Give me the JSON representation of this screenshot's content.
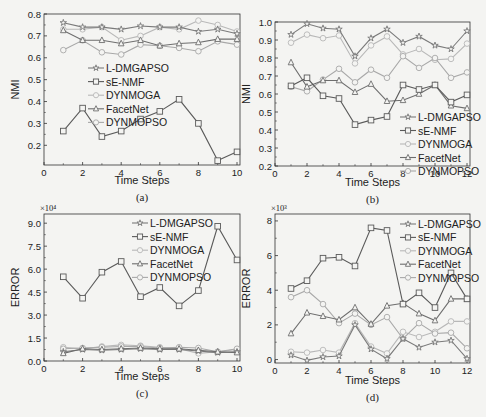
{
  "figure": {
    "panels": [
      {
        "id": "a",
        "caption": "(a)"
      },
      {
        "id": "b",
        "caption": "(b)"
      },
      {
        "id": "c",
        "caption": "(c)"
      },
      {
        "id": "d",
        "caption": "(d)"
      }
    ]
  },
  "series_styles": {
    "L-DMGAPSO": {
      "color": "#7a7a7a",
      "marker": "star"
    },
    "sE-NMF": {
      "color": "#5a5a5a",
      "marker": "square"
    },
    "DYNMOGA": {
      "color": "#b8b8b8",
      "marker": "circle"
    },
    "FacetNet": {
      "color": "#6e6e6e",
      "marker": "triangle"
    },
    "DYNMOPSO": {
      "color": "#a8a8a8",
      "marker": "circle"
    }
  },
  "chart_data": [
    {
      "panel": "a",
      "type": "line",
      "title": "",
      "caption": "(a)",
      "xlabel": "Time Steps",
      "ylabel": "NMI",
      "xlim": [
        0,
        10
      ],
      "ylim": [
        0.11,
        0.8
      ],
      "xticks": [
        0,
        2,
        4,
        6,
        8,
        10
      ],
      "yticks": [
        0.2,
        0.3,
        0.4,
        0.5,
        0.6,
        0.7,
        0.8
      ],
      "ytick_labels": [
        "0.2",
        "0.3",
        "0.4",
        "0.5",
        "0.6",
        "0.7",
        "0.8"
      ],
      "exponent_label": "",
      "legend_entries": [
        "L-DMGAPSO",
        "sE-NMF",
        "DYNMOGA",
        "FacetNet",
        "DYNMOPSO"
      ],
      "legend_position": "center-left",
      "grid": false,
      "x": [
        1,
        2,
        3,
        4,
        5,
        6,
        7,
        8,
        9,
        10
      ],
      "series": [
        {
          "name": "L-DMGAPSO",
          "values": [
            0.76,
            0.74,
            0.74,
            0.73,
            0.745,
            0.74,
            0.74,
            0.72,
            0.73,
            0.71
          ]
        },
        {
          "name": "sE-NMF",
          "values": [
            0.265,
            0.37,
            0.24,
            0.265,
            0.32,
            0.355,
            0.41,
            0.3,
            0.13,
            0.17
          ]
        },
        {
          "name": "DYNMOGA",
          "values": [
            0.73,
            0.73,
            0.74,
            0.68,
            0.7,
            0.74,
            0.73,
            0.77,
            0.75,
            0.72
          ]
        },
        {
          "name": "FacetNet",
          "values": [
            0.725,
            0.68,
            0.68,
            0.665,
            0.68,
            0.655,
            0.665,
            0.67,
            0.685,
            0.685
          ]
        },
        {
          "name": "DYNMOPSO",
          "values": [
            0.635,
            0.68,
            0.625,
            0.615,
            0.66,
            0.655,
            0.645,
            0.63,
            0.675,
            0.66
          ]
        }
      ]
    },
    {
      "panel": "b",
      "type": "line",
      "title": "",
      "caption": "(b)",
      "xlabel": "Time Steps",
      "ylabel": "NMI",
      "xlim": [
        0,
        12
      ],
      "ylim": [
        0.2,
        1.0
      ],
      "xticks": [
        0,
        2,
        4,
        6,
        8,
        10,
        12
      ],
      "yticks": [
        0.2,
        0.3,
        0.4,
        0.5,
        0.6,
        0.7,
        0.8,
        0.9,
        1.0
      ],
      "ytick_labels": [
        "0.2",
        "0.3",
        "0.4",
        "0.5",
        "0.6",
        "0.7",
        "0.8",
        "0.9",
        "1.0"
      ],
      "exponent_label": "",
      "legend_entries": [
        "L-DMGAPSO",
        "sE-NMF",
        "DYNMOGA",
        "FacetNet",
        "DYNMOPSO"
      ],
      "legend_position": "lower-right",
      "grid": false,
      "x": [
        1,
        2,
        3,
        4,
        5,
        6,
        7,
        8,
        9,
        10,
        11,
        12
      ],
      "series": [
        {
          "name": "L-DMGAPSO",
          "values": [
            0.93,
            0.99,
            0.965,
            0.96,
            0.81,
            0.91,
            0.96,
            0.885,
            0.92,
            0.87,
            0.85,
            0.95
          ]
        },
        {
          "name": "sE-NMF",
          "values": [
            0.645,
            0.69,
            0.59,
            0.575,
            0.43,
            0.455,
            0.475,
            0.65,
            0.625,
            0.65,
            0.555,
            0.595
          ]
        },
        {
          "name": "DYNMOGA",
          "values": [
            0.885,
            0.93,
            0.91,
            0.925,
            0.77,
            0.87,
            0.92,
            0.82,
            0.85,
            0.79,
            0.795,
            0.88
          ]
        },
        {
          "name": "FacetNet",
          "values": [
            0.775,
            0.64,
            0.675,
            0.675,
            0.61,
            0.655,
            0.56,
            0.565,
            0.6,
            0.65,
            0.535,
            0.52
          ]
        },
        {
          "name": "DYNMOPSO",
          "values": [
            0.64,
            0.615,
            0.68,
            0.74,
            0.665,
            0.735,
            0.69,
            0.81,
            0.745,
            0.8,
            0.69,
            0.72
          ]
        }
      ]
    },
    {
      "panel": "c",
      "type": "line",
      "title": "",
      "caption": "(c)",
      "xlabel": "Time Steps",
      "ylabel": "ERROR",
      "xlim": [
        0,
        10
      ],
      "ylim": [
        0,
        9.6
      ],
      "xticks": [
        0,
        2,
        4,
        6,
        8,
        10
      ],
      "yticks": [
        0,
        1.5,
        3.0,
        4.5,
        6.0,
        7.5,
        9.0
      ],
      "ytick_labels": [
        "0.0",
        "1.5",
        "3.0",
        "4.5",
        "6.0",
        "7.5",
        "9.0"
      ],
      "exponent_label": "×10⁴",
      "legend_entries": [
        "L-DMGAPSO",
        "sE-NMF",
        "DYNMOGA",
        "FacetNet",
        "DYNMOPSO"
      ],
      "legend_position": "upper-right",
      "grid": false,
      "x": [
        1,
        2,
        3,
        4,
        5,
        6,
        7,
        8,
        9,
        10
      ],
      "series": [
        {
          "name": "L-DMGAPSO",
          "values": [
            0.6,
            0.75,
            0.7,
            0.75,
            0.8,
            0.75,
            0.75,
            0.65,
            0.55,
            0.6
          ]
        },
        {
          "name": "sE-NMF",
          "values": [
            5.5,
            4.1,
            5.8,
            6.5,
            4.2,
            4.8,
            3.6,
            4.6,
            8.8,
            6.6
          ]
        },
        {
          "name": "DYNMOGA",
          "values": [
            0.9,
            0.8,
            0.95,
            1.05,
            1.0,
            0.9,
            0.8,
            0.5,
            0.6,
            0.75
          ]
        },
        {
          "name": "FacetNet",
          "values": [
            0.5,
            0.8,
            0.75,
            0.8,
            0.85,
            0.8,
            0.8,
            0.7,
            0.6,
            0.55
          ]
        },
        {
          "name": "DYNMOPSO",
          "values": [
            0.8,
            0.85,
            0.9,
            0.95,
            0.95,
            0.85,
            0.9,
            0.85,
            0.6,
            0.8
          ]
        }
      ]
    },
    {
      "panel": "d",
      "type": "line",
      "title": "",
      "caption": "(d)",
      "xlabel": "Time Steps",
      "ylabel": "ERROR",
      "xlim": [
        0,
        12
      ],
      "ylim": [
        -0.2,
        8.4
      ],
      "xticks": [
        0,
        2,
        4,
        6,
        8,
        10,
        12
      ],
      "yticks": [
        0,
        2,
        4,
        6,
        8
      ],
      "ytick_labels": [
        "0",
        "2",
        "4",
        "6",
        "8"
      ],
      "exponent_label": "×10³",
      "legend_entries": [
        "L-DMGAPSO",
        "sE-NMF",
        "DYNMOGA",
        "FacetNet",
        "DYNMOPSO"
      ],
      "legend_position": "upper-right",
      "grid": false,
      "x": [
        1,
        2,
        3,
        4,
        5,
        6,
        7,
        8,
        9,
        10,
        11,
        12
      ],
      "series": [
        {
          "name": "L-DMGAPSO",
          "values": [
            0.25,
            -0.05,
            0.15,
            0.2,
            2.0,
            0.6,
            0.05,
            1.2,
            0.7,
            1.0,
            1.1,
            0.05
          ]
        },
        {
          "name": "sE-NMF",
          "values": [
            4.1,
            4.55,
            5.85,
            5.9,
            5.4,
            7.6,
            7.45,
            3.2,
            3.85,
            3.0,
            5.0,
            3.5
          ]
        },
        {
          "name": "DYNMOGA",
          "values": [
            0.45,
            0.4,
            0.55,
            0.4,
            2.1,
            0.75,
            0.35,
            1.6,
            1.3,
            1.6,
            2.2,
            2.2
          ]
        },
        {
          "name": "FacetNet",
          "values": [
            1.5,
            2.7,
            2.5,
            2.3,
            3.0,
            2.05,
            3.1,
            3.25,
            2.65,
            2.25,
            3.5,
            3.5
          ]
        },
        {
          "name": "DYNMOPSO",
          "values": [
            3.6,
            4.0,
            3.2,
            2.1,
            2.65,
            2.0,
            2.45,
            1.2,
            2.1,
            1.5,
            1.55,
            0.65
          ]
        }
      ]
    }
  ]
}
